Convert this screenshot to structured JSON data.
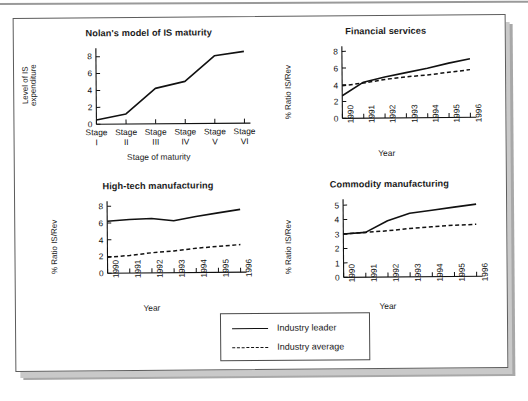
{
  "figure": {
    "background_color": "#ffffff",
    "card_border_color": "#5c5c5c",
    "line_color": "#111111"
  },
  "legend": {
    "items": [
      {
        "label": "Industry leader",
        "style": "solid"
      },
      {
        "label": "Industry average",
        "style": "dashed"
      }
    ]
  },
  "chart_data": [
    {
      "type": "line",
      "title": "Nolan's model of IS maturity",
      "xlabel": "Stage of maturity",
      "ylabel": "Level of IS expenditure",
      "categories": [
        "Stage I",
        "Stage II",
        "Stage III",
        "Stage IV",
        "Stage V",
        "Stage VI"
      ],
      "xtick_top": [
        "Stage",
        "Stage",
        "Stage",
        "Stage",
        "Stage",
        "Stage"
      ],
      "xtick_bottom": [
        "I",
        "II",
        "III",
        "IV",
        "V",
        "VI"
      ],
      "yticks": [
        0,
        2,
        4,
        6,
        8
      ],
      "ylim": [
        0,
        9
      ],
      "grid": false,
      "legend_position": "none",
      "series": [
        {
          "name": "Level of IS expenditure",
          "style": "solid",
          "values": [
            0.5,
            1.2,
            4.2,
            5.0,
            8.0,
            8.5
          ]
        }
      ]
    },
    {
      "type": "line",
      "title": "Financial services",
      "xlabel": "Year",
      "ylabel": "% Ratio IS/Rev",
      "categories": [
        "1990",
        "1991",
        "1992",
        "1993",
        "1994",
        "1995",
        "1996"
      ],
      "yticks": [
        0,
        2,
        4,
        6,
        8
      ],
      "ylim": [
        0,
        8.6
      ],
      "grid": false,
      "legend_position": "external",
      "series": [
        {
          "name": "Industry leader",
          "style": "solid",
          "values": [
            2.7,
            4.3,
            4.9,
            5.4,
            5.9,
            6.5,
            7.0
          ]
        },
        {
          "name": "Industry average",
          "style": "dashed",
          "values": [
            3.9,
            4.2,
            4.6,
            4.9,
            5.1,
            5.4,
            5.7
          ]
        }
      ]
    },
    {
      "type": "line",
      "title": "High-tech manufacturing",
      "xlabel": "Year",
      "ylabel": "% Ratio IS/Rev",
      "categories": [
        "1990",
        "1991",
        "1992",
        "1993",
        "1994",
        "1995",
        "1996"
      ],
      "yticks": [
        0,
        2,
        4,
        6,
        8
      ],
      "ylim": [
        0,
        8.6
      ],
      "grid": false,
      "legend_position": "external",
      "series": [
        {
          "name": "Industry leader",
          "style": "solid",
          "values": [
            6.2,
            6.4,
            6.5,
            6.2,
            6.7,
            7.1,
            7.5
          ]
        },
        {
          "name": "Industry average",
          "style": "dashed",
          "values": [
            1.9,
            2.1,
            2.4,
            2.6,
            2.9,
            3.1,
            3.3
          ]
        }
      ]
    },
    {
      "type": "line",
      "title": "Commodity manufacturing",
      "xlabel": "Year",
      "ylabel": "% Ratio IS/Rev",
      "categories": [
        "1990",
        "1991",
        "1992",
        "1993",
        "1994",
        "1995",
        "1996"
      ],
      "yticks": [
        0,
        1,
        2,
        3,
        4,
        5
      ],
      "ylim": [
        0,
        5.4
      ],
      "grid": false,
      "legend_position": "external",
      "series": [
        {
          "name": "Industry leader",
          "style": "solid",
          "values": [
            3.0,
            3.1,
            3.9,
            4.4,
            4.6,
            4.8,
            5.0
          ]
        },
        {
          "name": "Industry average",
          "style": "dashed",
          "values": [
            3.0,
            3.1,
            3.2,
            3.35,
            3.45,
            3.55,
            3.6
          ]
        }
      ]
    }
  ]
}
